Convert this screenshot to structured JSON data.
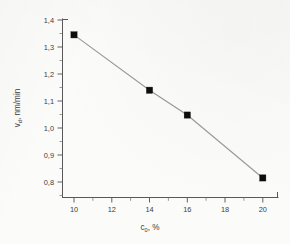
{
  "chart_data": {
    "type": "line",
    "title": "",
    "xlabel": "c0, %",
    "xlabel_base": "c",
    "xlabel_sub": "0",
    "xlabel_tail": ", %",
    "ylabel": "vd, nm/min",
    "ylabel_base": "v",
    "ylabel_sub": "d",
    "ylabel_tail": ", nm/min",
    "x": [
      10,
      14,
      16,
      20
    ],
    "values": [
      1.345,
      1.14,
      1.048,
      0.815
    ],
    "series": [
      {
        "name": "vd",
        "points": [
          {
            "x": 10,
            "y": 1.345
          },
          {
            "x": 14,
            "y": 1.14
          },
          {
            "x": 16,
            "y": 1.048
          },
          {
            "x": 20,
            "y": 0.815
          }
        ]
      }
    ],
    "xlim": [
      9.0,
      21.2
    ],
    "ylim": [
      0.755,
      1.4
    ],
    "xticks": [
      10,
      12,
      14,
      16,
      18,
      20
    ],
    "xticklabels": [
      "10",
      "12",
      "14",
      "16",
      "18",
      "20"
    ],
    "xminor_step": 1,
    "yticks": [
      0.8,
      0.9,
      1.0,
      1.1,
      1.2,
      1.3,
      1.4
    ],
    "yticklabels": [
      "0,8",
      "0,9",
      "1,0",
      "1,1",
      "1,2",
      "1,3",
      "1,4"
    ],
    "grid": false,
    "legend": false,
    "legend_position": "none",
    "marker": "filled-square",
    "marker_color": "#0d0d0d",
    "line_color": "#9a9a9a",
    "axis_color": "#58585a",
    "background_color": "#fbfbfa",
    "decimal_separator": ","
  }
}
